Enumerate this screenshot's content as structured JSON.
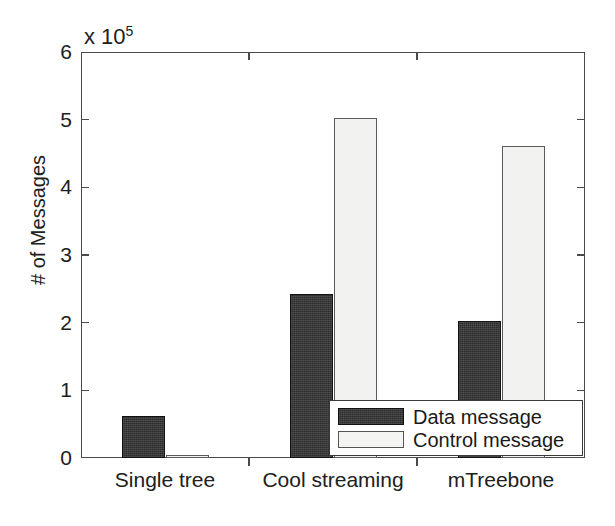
{
  "chart_data": {
    "type": "bar",
    "title": "",
    "xlabel": "",
    "ylabel": "# of Messages",
    "y_exponent_label": "x 10",
    "y_exponent_power": "5",
    "y_scale_multiplier": 100000,
    "categories": [
      "Single tree",
      "Cool streaming",
      "mTreebone"
    ],
    "series": [
      {
        "name": "Data message",
        "fill": "#2b2b2b",
        "values": [
          0.62,
          2.43,
          2.02
        ]
      },
      {
        "name": "Control message",
        "fill": "#f2f2f0",
        "values": [
          0.05,
          5.03,
          4.61
        ]
      }
    ],
    "ylim": [
      0,
      6
    ],
    "yticks": [
      0,
      1,
      2,
      3,
      4,
      5,
      6
    ],
    "ytick_labels": [
      "0",
      "1",
      "2",
      "3",
      "4",
      "5",
      "6"
    ],
    "grid": false,
    "legend": {
      "position": "bottom-right",
      "entries": [
        {
          "label": "Data message",
          "swatch": "dark"
        },
        {
          "label": "Control message",
          "swatch": "light"
        }
      ]
    }
  },
  "axes": {
    "plot_left_px": 81,
    "plot_top_px": 52,
    "plot_width_px": 504,
    "plot_height_px": 406
  }
}
